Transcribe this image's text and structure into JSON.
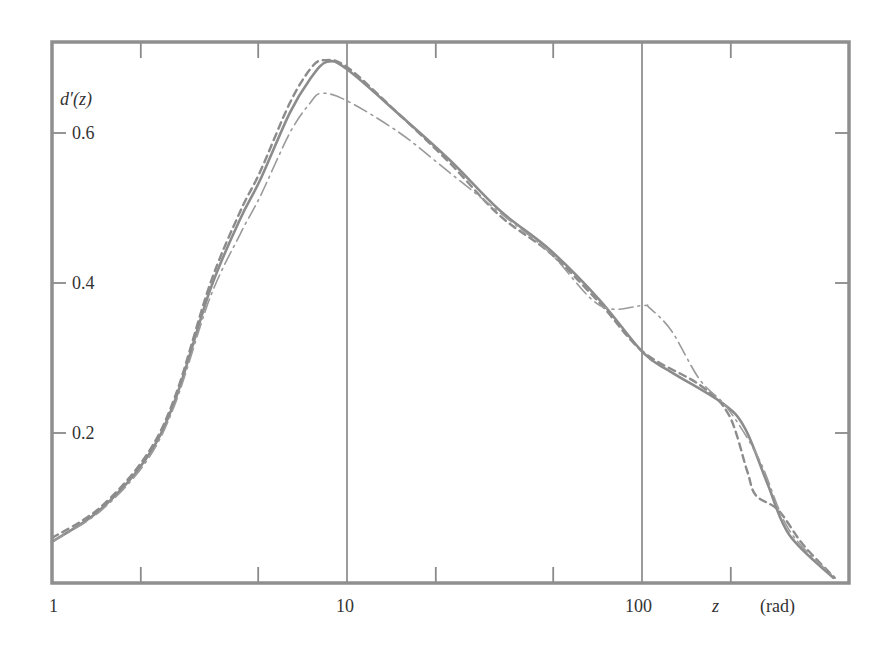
{
  "chart_data": {
    "type": "line",
    "title": "",
    "xlabel": "z",
    "xlabel_unit": "(rad)",
    "ylabel": "d′(z)",
    "xscale": "log",
    "xlim": [
      1,
      500
    ],
    "ylim": [
      0,
      0.72
    ],
    "x_tick_labels": [
      "1",
      "10",
      "100"
    ],
    "x_tick_values": [
      1,
      10,
      100
    ],
    "x_minor_ticks": [
      2,
      5,
      20,
      50,
      200
    ],
    "y_tick_labels": [
      "0.2",
      "0.4",
      "0.6"
    ],
    "y_tick_values": [
      0.2,
      0.4,
      0.6
    ],
    "grid": "vertical lines at decades (10, 100)",
    "legend": "none",
    "series": [
      {
        "name": "solid",
        "style": "solid",
        "x": [
          1,
          1.45,
          2.07,
          2.61,
          3.43,
          4.34,
          5.07,
          6.4,
          7.5,
          8.55,
          10,
          15.1,
          22.3,
          32.9,
          48.8,
          72,
          101,
          126,
          187,
          223,
          266,
          316,
          445
        ],
        "values": [
          0.055,
          0.097,
          0.164,
          0.243,
          0.39,
          0.485,
          0.537,
          0.627,
          0.672,
          0.695,
          0.685,
          0.624,
          0.564,
          0.497,
          0.444,
          0.377,
          0.307,
          0.281,
          0.24,
          0.207,
          0.133,
          0.064,
          0.007
        ]
      },
      {
        "name": "dashed",
        "style": "dashed",
        "x": [
          1,
          1.45,
          2.07,
          2.61,
          3.43,
          4.34,
          5.07,
          6.4,
          7.5,
          8.3,
          10,
          15.1,
          22.3,
          32.9,
          48.8,
          72,
          101,
          157,
          197,
          227,
          243,
          290,
          352,
          450
        ],
        "values": [
          0.06,
          0.1,
          0.168,
          0.248,
          0.398,
          0.495,
          0.548,
          0.64,
          0.685,
          0.697,
          0.688,
          0.624,
          0.56,
          0.49,
          0.44,
          0.373,
          0.308,
          0.264,
          0.224,
          0.15,
          0.117,
          0.097,
          0.051,
          0.007
        ]
      },
      {
        "name": "dash-dot",
        "style": "dash-dot",
        "x": [
          1,
          1.45,
          2.07,
          2.61,
          3.43,
          4.34,
          5.07,
          6.4,
          7.5,
          8.2,
          10,
          15.1,
          22.3,
          32.9,
          48.8,
          72,
          101,
          106,
          126,
          157,
          195,
          250,
          316,
          450
        ],
        "values": [
          0.055,
          0.095,
          0.16,
          0.238,
          0.38,
          0.465,
          0.515,
          0.6,
          0.64,
          0.653,
          0.643,
          0.6,
          0.547,
          0.494,
          0.44,
          0.37,
          0.37,
          0.367,
          0.336,
          0.271,
          0.233,
          0.164,
          0.07,
          0.007
        ]
      }
    ]
  },
  "axes": {
    "y_label_main": "d′",
    "y_label_arg": "(z)",
    "x_label": "z",
    "x_unit": "(rad)"
  }
}
